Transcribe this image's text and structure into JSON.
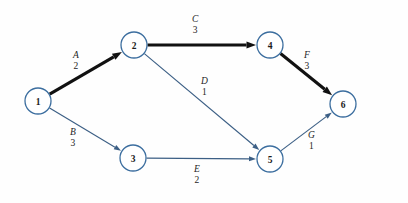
{
  "diagram": {
    "colors": {
      "node_stroke": "#3c6e9f",
      "node_fill": "#ffffff",
      "edge_normal": "#3c5f85",
      "edge_critical": "#111111",
      "background": "#fefefe",
      "text": "#1d1d1d"
    },
    "nodes": [
      {
        "id": "1",
        "label": "1",
        "x": 38,
        "y": 101,
        "r": 13
      },
      {
        "id": "2",
        "label": "2",
        "x": 134,
        "y": 45,
        "r": 13
      },
      {
        "id": "3",
        "label": "3",
        "x": 133,
        "y": 158,
        "r": 13
      },
      {
        "id": "4",
        "label": "4",
        "x": 270,
        "y": 45,
        "r": 13
      },
      {
        "id": "5",
        "label": "5",
        "x": 270,
        "y": 159,
        "r": 13
      },
      {
        "id": "6",
        "label": "6",
        "x": 343,
        "y": 104,
        "r": 13
      }
    ],
    "edges": [
      {
        "id": "A",
        "activity": "A",
        "duration": "2",
        "from": "1",
        "to": "2",
        "critical": true,
        "label_x": 73,
        "label_y": 50
      },
      {
        "id": "B",
        "activity": "B",
        "duration": "3",
        "from": "1",
        "to": "3",
        "critical": false,
        "label_x": 70,
        "label_y": 127
      },
      {
        "id": "C",
        "activity": "C",
        "duration": "3",
        "from": "2",
        "to": "4",
        "critical": true,
        "label_x": 192,
        "label_y": 14
      },
      {
        "id": "D",
        "activity": "D",
        "duration": "1",
        "from": "2",
        "to": "5",
        "critical": false,
        "label_x": 201,
        "label_y": 76
      },
      {
        "id": "E",
        "activity": "E",
        "duration": "2",
        "from": "3",
        "to": "5",
        "critical": false,
        "label_x": 194,
        "label_y": 164
      },
      {
        "id": "F",
        "activity": "F",
        "duration": "3",
        "from": "4",
        "to": "6",
        "critical": true,
        "label_x": 304,
        "label_y": 50
      },
      {
        "id": "G",
        "activity": "G",
        "duration": "1",
        "from": "5",
        "to": "6",
        "critical": false,
        "label_x": 308,
        "label_y": 130
      }
    ]
  }
}
